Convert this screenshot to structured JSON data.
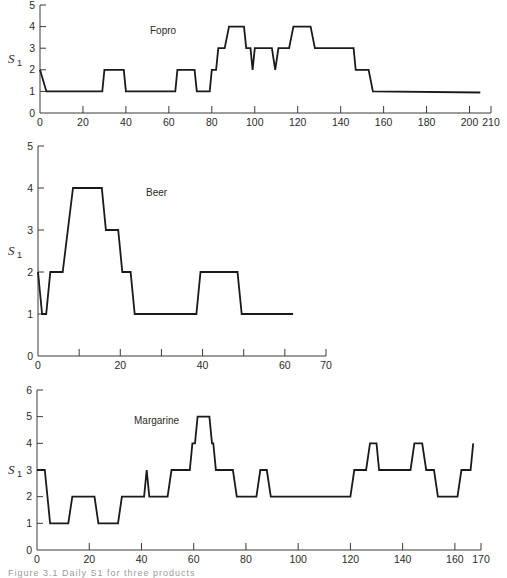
{
  "figure": {
    "caption_fragment": "Figure 3.1  Daily S1 for three products"
  },
  "chart_data": [
    {
      "type": "line",
      "title": "Fopro",
      "xlabel": "",
      "ylabel": "S1",
      "xlim": [
        0,
        210
      ],
      "ylim": [
        0,
        5
      ],
      "xticks": [
        0,
        20,
        40,
        60,
        80,
        100,
        120,
        140,
        160,
        180,
        200,
        210
      ],
      "yticks": [
        0,
        1,
        2,
        3,
        4,
        5
      ],
      "grid": false,
      "legend": "none",
      "frame": {
        "x0": 40,
        "x1": 491,
        "y0": 113,
        "y1": 5,
        "label_x": 150,
        "label_y": 34
      },
      "x": [
        0,
        3,
        29,
        30,
        39,
        40,
        63,
        64,
        72,
        73,
        79,
        80,
        82,
        83,
        85,
        86,
        88,
        89,
        95,
        96,
        98,
        99,
        100,
        108,
        109.5,
        111,
        116,
        118,
        119,
        126,
        128,
        146,
        147,
        153,
        155,
        205
      ],
      "y": [
        2,
        1,
        1,
        2,
        2,
        1,
        1,
        2,
        2,
        1,
        1,
        2,
        2,
        3,
        3,
        3,
        4,
        4,
        4,
        3,
        3,
        2,
        3,
        3,
        2,
        3,
        3,
        4,
        4,
        4,
        3,
        3,
        2,
        2,
        1,
        0.95
      ]
    },
    {
      "type": "line",
      "title": "Beer",
      "xlabel": "",
      "ylabel": "S1",
      "xlim": [
        0,
        70
      ],
      "ylim": [
        0,
        5
      ],
      "xticks": [
        0,
        10,
        20,
        30,
        40,
        50,
        60,
        70
      ],
      "xtick_labels": [
        "0",
        "",
        "20",
        "",
        "40",
        "",
        "60",
        "70"
      ],
      "yticks": [
        0,
        1,
        2,
        3,
        4,
        5
      ],
      "grid": false,
      "legend": "none",
      "frame": {
        "x0": 38,
        "x1": 326,
        "y0": 356,
        "y1": 146,
        "label_x": 146,
        "label_y": 196
      },
      "x": [
        0,
        1,
        2,
        3,
        6,
        8.5,
        15.5,
        16.5,
        19.5,
        20.5,
        22.5,
        23.5,
        38.5,
        39.5,
        48.5,
        49.5,
        62
      ],
      "y": [
        2,
        1,
        1,
        2,
        2,
        4,
        4,
        3,
        3,
        2,
        2,
        1,
        1,
        2,
        2,
        1,
        1
      ]
    },
    {
      "type": "line",
      "title": "Margarine",
      "xlabel": "",
      "ylabel": "S1",
      "xlim": [
        0,
        170
      ],
      "ylim": [
        0,
        6
      ],
      "xticks": [
        0,
        20,
        40,
        60,
        80,
        100,
        120,
        140,
        160,
        170
      ],
      "yticks": [
        0,
        1,
        2,
        3,
        4,
        5,
        6
      ],
      "grid": false,
      "legend": "none",
      "frame": {
        "x0": 37,
        "x1": 481,
        "y0": 550,
        "y1": 390,
        "label_x": 134,
        "label_y": 424
      },
      "x": [
        0,
        3,
        5,
        12,
        13.5,
        22,
        23.5,
        31,
        32.5,
        41,
        42,
        43,
        50,
        51.5,
        58.5,
        59.5,
        60.5,
        61.5,
        66,
        67,
        67.5,
        68.5,
        75,
        76.5,
        84,
        85.5,
        88,
        89.5,
        120,
        121.5,
        126,
        127.5,
        130,
        131,
        143,
        144.5,
        147.5,
        149,
        152,
        153.5,
        161,
        162.5,
        166,
        167
      ],
      "y": [
        3,
        3,
        1,
        1,
        2,
        2,
        1,
        1,
        2,
        2,
        3,
        2,
        2,
        3,
        3,
        4,
        4,
        5,
        5,
        4,
        4,
        3,
        3,
        2,
        2,
        3,
        3,
        2,
        2,
        3,
        3,
        4,
        4,
        3,
        3,
        4,
        4,
        3,
        3,
        2,
        2,
        3,
        3,
        4
      ]
    }
  ]
}
